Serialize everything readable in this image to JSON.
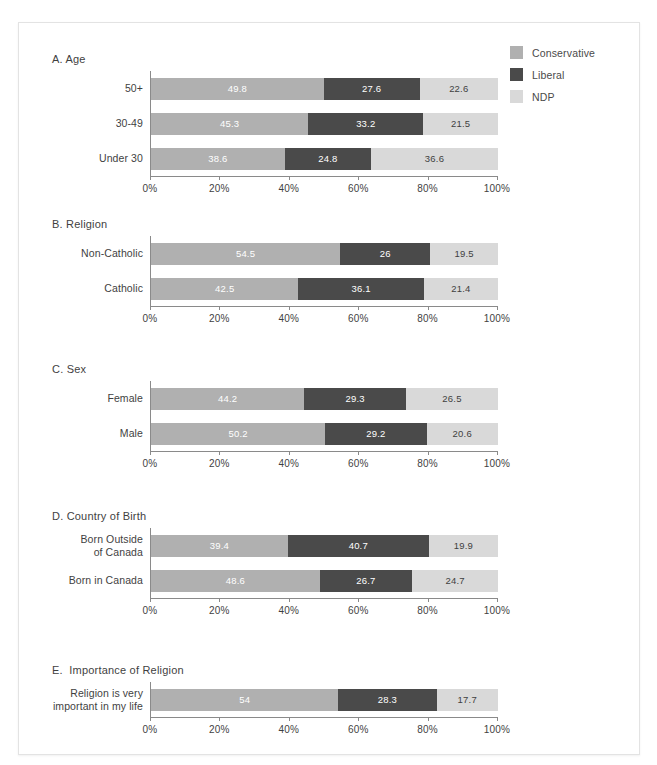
{
  "legend": {
    "position": "top-right",
    "items": [
      {
        "label": "Conservative",
        "color": "#b0b0b0",
        "icon": "square-swatch-icon"
      },
      {
        "label": "Liberal",
        "color": "#4a4a4a",
        "icon": "square-swatch-icon"
      },
      {
        "label": "NDP",
        "color": "#d9d9d9",
        "icon": "square-swatch-icon"
      }
    ]
  },
  "axis": {
    "ticks": [
      "0%",
      "20%",
      "40%",
      "60%",
      "80%",
      "100%"
    ],
    "tick_values": [
      0,
      20,
      40,
      60,
      80,
      100
    ]
  },
  "chart_data": {
    "type": "bar",
    "orientation": "horizontal",
    "stacked": true,
    "normalized": true,
    "title": "",
    "xlabel": "",
    "ylabel": "",
    "xlim": [
      0,
      100
    ],
    "grid": false,
    "legend_position": "top-right",
    "series": [
      {
        "name": "Conservative",
        "color": "#b0b0b0"
      },
      {
        "name": "Liberal",
        "color": "#4a4a4a"
      },
      {
        "name": "NDP",
        "color": "#d9d9d9"
      }
    ],
    "panels": [
      {
        "title": "A. Age",
        "categories": [
          "50+",
          "30-49",
          "Under 30"
        ],
        "rows": [
          {
            "label": "50+",
            "values": [
              49.8,
              27.6,
              22.6
            ],
            "labels": [
              "49.8",
              "27.6",
              "22.6"
            ]
          },
          {
            "label": "30-49",
            "values": [
              45.3,
              33.2,
              21.5
            ],
            "labels": [
              "45.3",
              "33.2",
              "21.5"
            ]
          },
          {
            "label": "Under 30",
            "values": [
              38.6,
              24.8,
              36.6
            ],
            "labels": [
              "38.6",
              "24.8",
              "36.6"
            ]
          }
        ]
      },
      {
        "title": "B. Religion",
        "categories": [
          "Non-Catholic",
          "Catholic"
        ],
        "rows": [
          {
            "label": "Non-Catholic",
            "values": [
              54.5,
              26,
              19.5
            ],
            "labels": [
              "54.5",
              "26",
              "19.5"
            ]
          },
          {
            "label": "Catholic",
            "values": [
              42.5,
              36.1,
              21.4
            ],
            "labels": [
              "42.5",
              "36.1",
              "21.4"
            ]
          }
        ]
      },
      {
        "title": "C. Sex",
        "categories": [
          "Female",
          "Male"
        ],
        "rows": [
          {
            "label": "Female",
            "values": [
              44.2,
              29.3,
              26.5
            ],
            "labels": [
              "44.2",
              "29.3",
              "26.5"
            ]
          },
          {
            "label": "Male",
            "values": [
              50.2,
              29.2,
              20.6
            ],
            "labels": [
              "50.2",
              "29.2",
              "20.6"
            ]
          }
        ]
      },
      {
        "title": "D. Country of Birth",
        "categories": [
          "Born Outside of Canada",
          "Born in Canada"
        ],
        "rows": [
          {
            "label": "Born Outside\nof Canada",
            "values": [
              39.4,
              40.7,
              19.9
            ],
            "labels": [
              "39.4",
              "40.7",
              "19.9"
            ]
          },
          {
            "label": "Born in Canada",
            "values": [
              48.6,
              26.7,
              24.7
            ],
            "labels": [
              "48.6",
              "26.7",
              "24.7"
            ]
          }
        ]
      },
      {
        "title": "E.  Importance of Religion",
        "categories": [
          "Religion is very important in my life"
        ],
        "rows": [
          {
            "label": "Religion is very\nimportant in my life",
            "values": [
              54,
              28.3,
              17.7
            ],
            "labels": [
              "54",
              "28.3",
              "17.7"
            ]
          }
        ]
      }
    ]
  }
}
